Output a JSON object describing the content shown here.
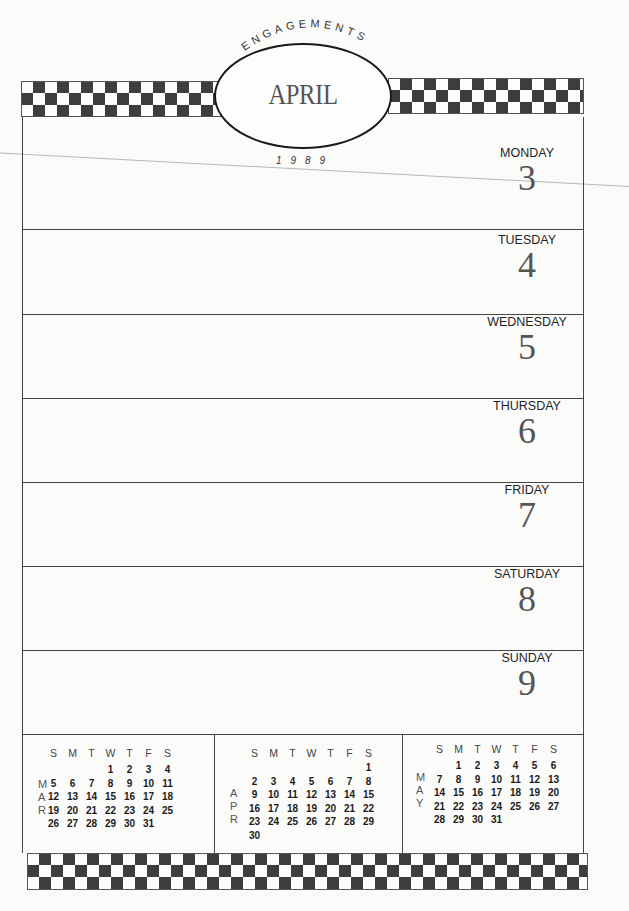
{
  "header": {
    "arc_title": "ENGAGEMENTS",
    "month": "APRIL",
    "year": "1989"
  },
  "days": [
    {
      "name": "MONDAY",
      "number": "3"
    },
    {
      "name": "TUESDAY",
      "number": "4"
    },
    {
      "name": "WEDNESDAY",
      "number": "5"
    },
    {
      "name": "THURSDAY",
      "number": "6"
    },
    {
      "name": "FRIDAY",
      "number": "7"
    },
    {
      "name": "SATURDAY",
      "number": "8"
    },
    {
      "name": "SUNDAY",
      "number": "9"
    }
  ],
  "mini_calendars": [
    {
      "label_letters": [
        "M",
        "A",
        "R"
      ],
      "weekday_headers": [
        "S",
        "M",
        "T",
        "W",
        "T",
        "F",
        "S"
      ],
      "cells": [
        "",
        "",
        "",
        "1",
        "2",
        "3",
        "4",
        "5",
        "6",
        "7",
        "8",
        "9",
        "10",
        "11",
        "12",
        "13",
        "14",
        "15",
        "16",
        "17",
        "18",
        "19",
        "20",
        "21",
        "22",
        "23",
        "24",
        "25",
        "26",
        "27",
        "28",
        "29",
        "30",
        "31",
        ""
      ]
    },
    {
      "label_letters": [
        "A",
        "P",
        "R"
      ],
      "weekday_headers": [
        "S",
        "M",
        "T",
        "W",
        "T",
        "F",
        "S"
      ],
      "cells": [
        "",
        "",
        "",
        "",
        "",
        "",
        "1",
        "2",
        "3",
        "4",
        "5",
        "6",
        "7",
        "8",
        "9",
        "10",
        "11",
        "12",
        "13",
        "14",
        "15",
        "16",
        "17",
        "18",
        "19",
        "20",
        "21",
        "22",
        "23",
        "24",
        "25",
        "26",
        "27",
        "28",
        "29",
        "30",
        "",
        "",
        "",
        "",
        "",
        ""
      ]
    },
    {
      "label_letters": [
        "M",
        "A",
        "Y"
      ],
      "weekday_headers": [
        "S",
        "M",
        "T",
        "W",
        "T",
        "F",
        "S"
      ],
      "cells": [
        "",
        "1",
        "2",
        "3",
        "4",
        "5",
        "6",
        "7",
        "8",
        "9",
        "10",
        "11",
        "12",
        "13",
        "14",
        "15",
        "16",
        "17",
        "18",
        "19",
        "20",
        "21",
        "22",
        "23",
        "24",
        "25",
        "26",
        "27",
        "28",
        "29",
        "30",
        "31",
        "",
        "",
        ""
      ]
    }
  ],
  "colors": {
    "checker_dark": "#3d3d3d",
    "paper": "#fbfbfa",
    "rule": "#444444"
  }
}
